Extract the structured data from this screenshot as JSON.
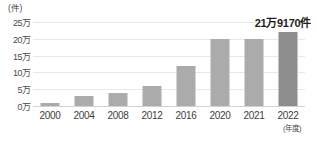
{
  "chart_data": {
    "type": "bar",
    "title": "",
    "subtitle": "",
    "xlabel": "(年度)",
    "ylabel": "(件)",
    "categories": [
      "2000",
      "2004",
      "2008",
      "2012",
      "2016",
      "2020",
      "2021",
      "2022"
    ],
    "values": [
      10000,
      30000,
      40000,
      60000,
      120000,
      200000,
      200000,
      219170
    ],
    "ylim": [
      0,
      250000
    ],
    "y_tick_values": [
      250000,
      200000,
      150000,
      100000,
      50000,
      0
    ],
    "y_tick_labels": [
      "25万",
      "20万",
      "15万",
      "10万",
      "5万",
      "0万"
    ],
    "grid": true,
    "legend": false,
    "annotations": [
      {
        "text": "21万9170件",
        "category": "2022",
        "value": 219170
      }
    ],
    "series": [
      {
        "name": "件数",
        "values": [
          10000,
          30000,
          40000,
          60000,
          120000,
          200000,
          200000,
          219170
        ],
        "colors": [
          "#ababab",
          "#ababab",
          "#ababab",
          "#ababab",
          "#ababab",
          "#ababab",
          "#ababab",
          "#8d8d8d"
        ]
      }
    ],
    "colors": {
      "bar": "#ababab",
      "bar_highlight": "#8d8d8d",
      "grid": "#e8e8e8",
      "axis": "#d2d2d2",
      "text": "#3d3d3d",
      "annotation": "#1f1f1f",
      "background": "#ffffff"
    }
  }
}
